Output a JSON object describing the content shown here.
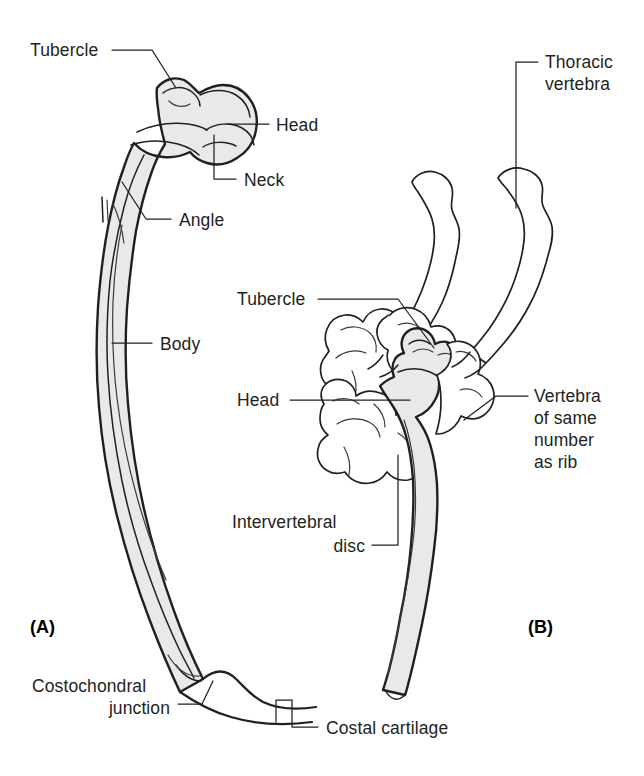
{
  "figure": {
    "background_color": "#ffffff",
    "bone_fill_color": "#e9e9e7",
    "line_color": "#231f20",
    "width": 644,
    "height": 776
  },
  "panels": [
    {
      "id": "A",
      "label": "(A)",
      "description": "A typical rib viewed from behind showing its parts"
    },
    {
      "id": "B",
      "label": "(B)",
      "description": "Lateral view of rib articulating with thoracic vertebrae"
    }
  ],
  "panel_a": {
    "label": "(A)",
    "annotations": [
      {
        "id": "tubercle",
        "text": "Tubercle",
        "lines": [
          "Tubercle"
        ]
      },
      {
        "id": "head",
        "text": "Head",
        "lines": [
          "Head"
        ]
      },
      {
        "id": "neck",
        "text": "Neck",
        "lines": [
          "Neck"
        ]
      },
      {
        "id": "angle",
        "text": "Angle",
        "lines": [
          "Angle"
        ]
      },
      {
        "id": "body",
        "text": "Body",
        "lines": [
          "Body"
        ]
      },
      {
        "id": "costochondral-junction",
        "text": "Costochondral junction",
        "lines": [
          "Costochondral",
          "junction"
        ]
      },
      {
        "id": "costal-cartilage",
        "text": "Costal cartilage",
        "lines": [
          "Costal cartilage"
        ]
      }
    ]
  },
  "panel_b": {
    "label": "(B)",
    "annotations": [
      {
        "id": "thoracic-vertebra",
        "text": "Thoracic vertebra",
        "lines": [
          "Thoracic",
          "vertebra"
        ]
      },
      {
        "id": "tubercle",
        "text": "Tubercle",
        "lines": [
          "Tubercle"
        ]
      },
      {
        "id": "head",
        "text": "Head",
        "lines": [
          "Head"
        ]
      },
      {
        "id": "vertebra-same-number",
        "text": "Vertebra of same number as rib",
        "lines": [
          "Vertebra",
          "of same",
          "number",
          "as rib"
        ]
      },
      {
        "id": "intervertebral-disc",
        "text": "Intervertebral disc",
        "lines": [
          "Intervertebral",
          "disc"
        ]
      }
    ]
  }
}
